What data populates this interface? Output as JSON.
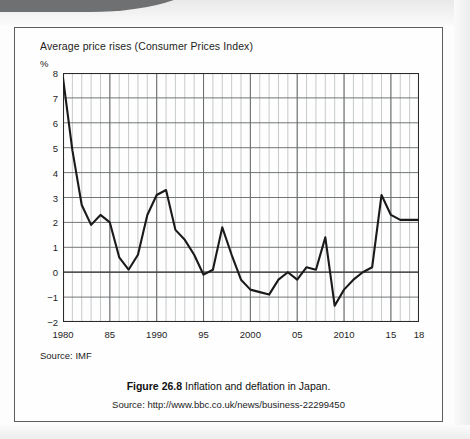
{
  "figure": {
    "caption_label": "Figure 26.8",
    "caption_text": "Inflation and deflation in Japan.",
    "source_line": "Source: http://www.bbc.co.uk/news/business-22299450",
    "chart_source": "Source: IMF"
  },
  "chart_data": {
    "type": "line",
    "title": "Average price rises (Consumer Prices Index)",
    "xlabel": "",
    "ylabel": "%",
    "yunit": "%",
    "xlim": [
      1980,
      2018
    ],
    "ylim": [
      -2,
      8
    ],
    "grid": true,
    "legend": "none",
    "ytick_labels": [
      "8",
      "7",
      "6",
      "5",
      "4",
      "3",
      "2",
      "1",
      "0",
      "−1",
      "−2"
    ],
    "ytick_values": [
      8,
      7,
      6,
      5,
      4,
      3,
      2,
      1,
      0,
      -1,
      -2
    ],
    "xtick_labels": [
      "1980",
      "85",
      "1990",
      "95",
      "2000",
      "05",
      "2010",
      "15",
      "18"
    ],
    "xtick_values": [
      1980,
      1985,
      1990,
      1995,
      2000,
      2005,
      2010,
      2015,
      2018
    ],
    "minor_x_step": 1,
    "series": [
      {
        "name": "Japan CPI annual change",
        "x": [
          1980,
          1981,
          1982,
          1983,
          1984,
          1985,
          1986,
          1987,
          1988,
          1989,
          1990,
          1991,
          1992,
          1993,
          1994,
          1995,
          1996,
          1997,
          1998,
          1999,
          2000,
          2001,
          2002,
          2003,
          2004,
          2005,
          2006,
          2007,
          2008,
          2009,
          2010,
          2011,
          2012,
          2013,
          2014,
          2015,
          2016,
          2017,
          2018
        ],
        "values": [
          7.8,
          4.9,
          2.7,
          1.9,
          2.3,
          2.0,
          0.6,
          0.1,
          0.7,
          2.3,
          3.1,
          3.3,
          1.7,
          1.3,
          0.7,
          -0.1,
          0.1,
          1.8,
          0.7,
          -0.3,
          -0.7,
          -0.8,
          -0.9,
          -0.3,
          0.0,
          -0.3,
          0.2,
          0.1,
          1.4,
          -1.35,
          -0.7,
          -0.3,
          0.0,
          0.2,
          3.1,
          2.3,
          2.1,
          2.1,
          2.1
        ]
      }
    ]
  }
}
